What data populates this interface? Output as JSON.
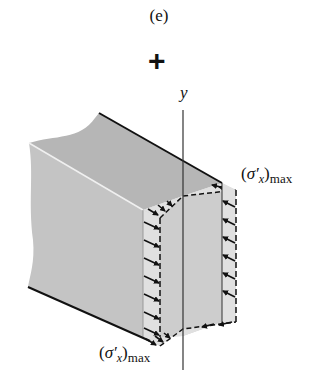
{
  "figure": {
    "panel_label": "(e)",
    "sign": "+",
    "axis": {
      "label": "y"
    },
    "stress_labels": {
      "top": {
        "open": "(",
        "symbol": "σ′",
        "subscript": "x",
        "close": ")",
        "suffix": "max"
      },
      "bottom": {
        "open": "(",
        "symbol": "σ′",
        "subscript": "x",
        "close": ")",
        "suffix": "max"
      }
    },
    "colors": {
      "beam_top": "#b4b4b4",
      "beam_side": "#c2c2c2",
      "beam_front": "#cfcfcf",
      "stress_fill": "#dcdcdc",
      "edge": "#111111"
    }
  }
}
